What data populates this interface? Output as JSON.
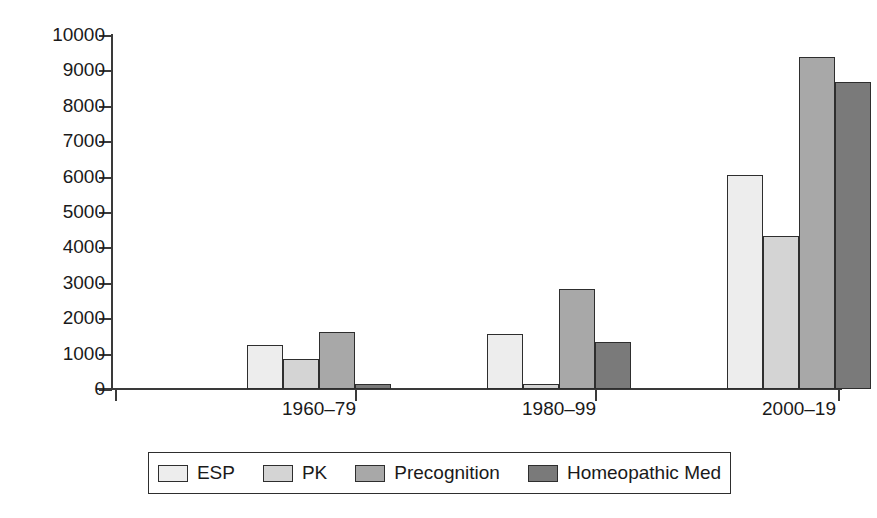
{
  "chart_data": {
    "type": "bar",
    "title": "",
    "subtitle": "",
    "xlabel": "",
    "ylabel": "",
    "categories": [
      "1960–79",
      "1980–99",
      "2000–19"
    ],
    "series": [
      {
        "name": "ESP",
        "color": "#ededed",
        "values": [
          1250,
          1540,
          6050
        ]
      },
      {
        "name": "PK",
        "color": "#d4d4d4",
        "values": [
          850,
          130,
          4320
        ]
      },
      {
        "name": "Precognition",
        "color": "#a8a8a8",
        "values": [
          1620,
          2830,
          9380
        ]
      },
      {
        "name": "Homeopathic Med",
        "color": "#7a7a7a",
        "values": [
          140,
          1340,
          8680
        ]
      }
    ],
    "ylim": [
      0,
      10000
    ],
    "ytick_values": [
      0,
      1000,
      2000,
      3000,
      4000,
      5000,
      6000,
      7000,
      8000,
      9000,
      10000
    ],
    "ytick_labels": [
      "0",
      "1000",
      "2000",
      "3000",
      "4000",
      "5000",
      "6000",
      "7000",
      "8000",
      "9000",
      "10000"
    ],
    "grid": false,
    "legend_position": "bottom",
    "legend_entries": [
      "ESP",
      "PK",
      "Precognition",
      "Homeopathic Med"
    ]
  },
  "axes": {
    "axis_color": "#3a3a3a",
    "bar_edge_color": "#2e2e2e",
    "background": "#ffffff"
  }
}
